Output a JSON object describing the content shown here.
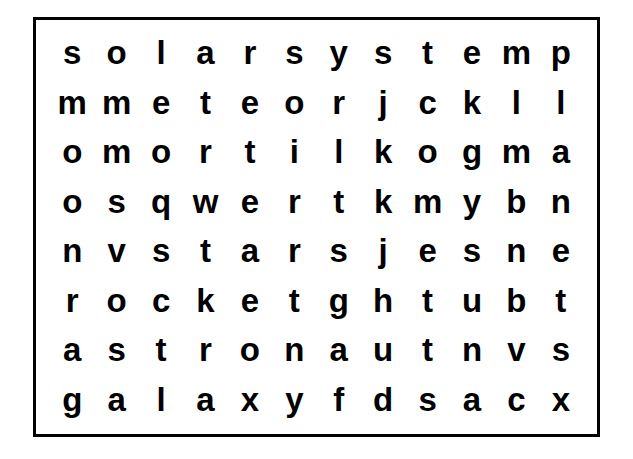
{
  "puzzle": {
    "type": "word-search",
    "columns": 12,
    "rows": 8,
    "border_color": "#000000",
    "background_color": "#ffffff",
    "letter_color": "#000000",
    "grid": [
      [
        "s",
        "o",
        "l",
        "a",
        "r",
        "s",
        "y",
        "s",
        "t",
        "e",
        "m",
        "p"
      ],
      [
        "m",
        "m",
        "e",
        "t",
        "e",
        "o",
        "r",
        "j",
        "c",
        "k",
        "l",
        "l"
      ],
      [
        "o",
        "m",
        "o",
        "r",
        "t",
        "i",
        "l",
        "k",
        "o",
        "g",
        "m",
        "a"
      ],
      [
        "o",
        "s",
        "q",
        "w",
        "e",
        "r",
        "t",
        "k",
        "m",
        "y",
        "b",
        "n"
      ],
      [
        "n",
        "v",
        "s",
        "t",
        "a",
        "r",
        "s",
        "j",
        "e",
        "s",
        "n",
        "e"
      ],
      [
        "r",
        "o",
        "c",
        "k",
        "e",
        "t",
        "g",
        "h",
        "t",
        "u",
        "b",
        "t"
      ],
      [
        "a",
        "s",
        "t",
        "r",
        "o",
        "n",
        "a",
        "u",
        "t",
        "n",
        "v",
        "s"
      ],
      [
        "g",
        "a",
        "l",
        "a",
        "x",
        "y",
        "f",
        "d",
        "s",
        "a",
        "c",
        "x"
      ]
    ],
    "row_strings": [
      "solarsystemp",
      "mmeteorjckll",
      "omortilkogma",
      "osqwertkmybn",
      "nvstarsjesne",
      "rocketghtubt",
      "astronautnvs",
      "galaxyfdsacx"
    ]
  }
}
